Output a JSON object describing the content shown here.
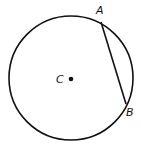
{
  "diagram": {
    "circle": {
      "cx": 71,
      "cy": 78,
      "r": 62
    },
    "center": {
      "label": "C",
      "x": 71,
      "y": 79
    },
    "points": [
      {
        "label": "A",
        "x": 101,
        "y": 22,
        "label_x": 96,
        "label_y": 14
      },
      {
        "label": "B",
        "x": 126,
        "y": 104,
        "label_x": 126,
        "label_y": 116
      }
    ],
    "chord": {
      "from": "A",
      "to": "B"
    },
    "stroke_color": "#111111"
  }
}
